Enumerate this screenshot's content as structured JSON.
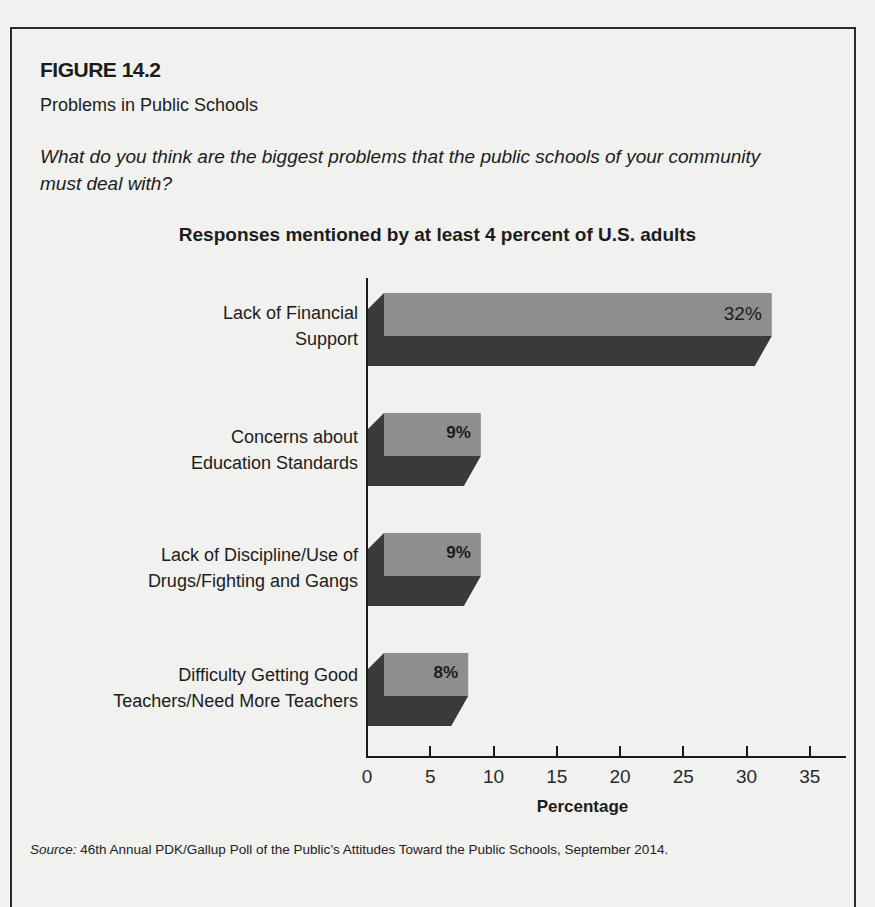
{
  "figure": {
    "number": "FIGURE 14.2",
    "title": "Problems in Public Schools",
    "question": "What do you think are the biggest problems that the public schools of your community must deal with?",
    "source_label": "Source:",
    "source_text": " 46th Annual PDK/Gallup Poll of the Public’s Attitudes Toward the Public Schools, September 2014."
  },
  "colors": {
    "bar_front": "#8e8e8e",
    "bar_shadow": "#3a3a3a",
    "background": "#f1f1ef",
    "axis": "#1a1a1a"
  },
  "chart_data": {
    "type": "bar",
    "orientation": "horizontal",
    "style": "3d",
    "title": "Responses mentioned by at least 4 percent of U.S. adults",
    "xlabel": "Percentage",
    "ylabel": "",
    "xlim": [
      0,
      35
    ],
    "xticks": [
      "0",
      "5",
      "10",
      "15",
      "20",
      "25",
      "30",
      "35"
    ],
    "grid": false,
    "legend": null,
    "categories": [
      "Lack of Financial Support",
      "Concerns about Education Standards",
      "Lack of Discipline/Use of Drugs/Fighting and Gangs",
      "Difficulty Getting Good Teachers/Need More Teachers"
    ],
    "category_lines": [
      [
        "Lack of Financial",
        "Support"
      ],
      [
        "Concerns about",
        "Education Standards"
      ],
      [
        "Lack of Discipline/Use of",
        "Drugs/Fighting and Gangs"
      ],
      [
        "Difficulty Getting Good",
        "Teachers/Need More Teachers"
      ]
    ],
    "values": [
      32,
      9,
      9,
      8
    ],
    "value_labels": [
      "32%",
      "9%",
      "9%",
      "8%"
    ]
  }
}
